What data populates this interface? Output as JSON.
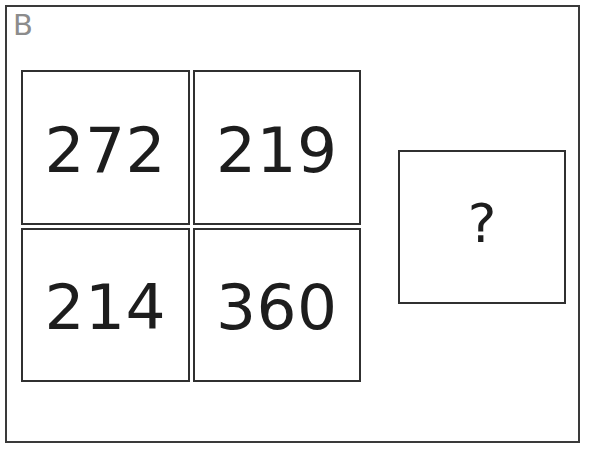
{
  "panel": {
    "label": "B",
    "label_color": "#8c8c8c",
    "border_color": "#3a3a3a",
    "background_color": "#ffffff"
  },
  "matrix": {
    "rows": 2,
    "columns": 2,
    "cell_border_color": "#303030",
    "text_color": "#1d1d1d",
    "cells": [
      {
        "value": "272",
        "row": 1,
        "column": 1
      },
      {
        "value": "219",
        "row": 1,
        "column": 2
      },
      {
        "value": "214",
        "row": 2,
        "column": 1
      },
      {
        "value": "360",
        "row": 2,
        "column": 2
      }
    ]
  },
  "answer": {
    "value": "?",
    "border_color": "#303030",
    "text_color": "#1d1d1d"
  }
}
